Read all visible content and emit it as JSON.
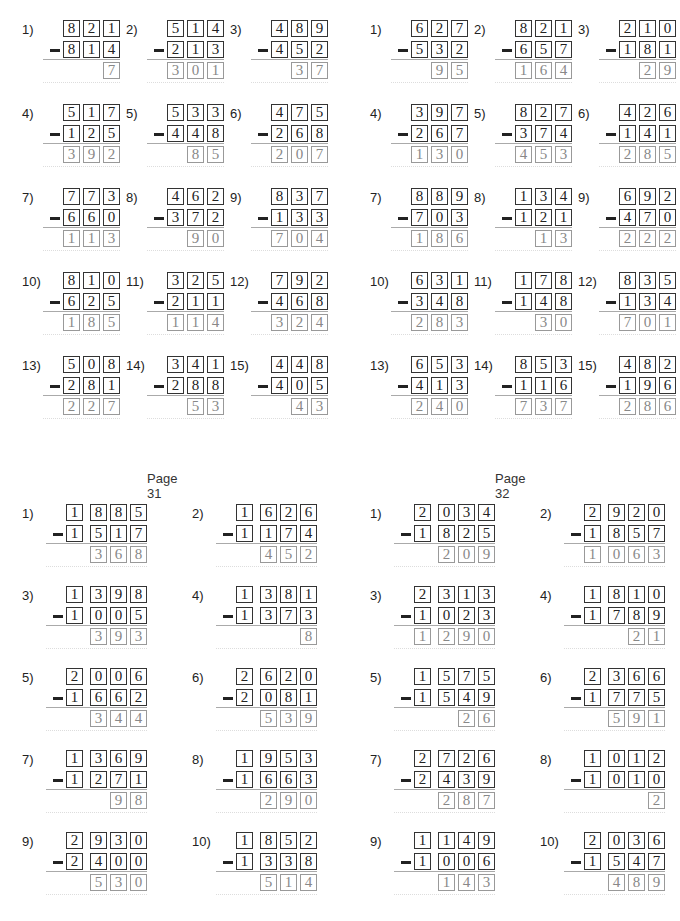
{
  "pages": [
    {
      "label": "",
      "grid": "3digit",
      "x0": 22,
      "y0": 20,
      "problems": [
        {
          "n": "1)",
          "top": "821",
          "bottom": "814",
          "answer": "7"
        },
        {
          "n": "2)",
          "top": "514",
          "bottom": "213",
          "answer": "301"
        },
        {
          "n": "3)",
          "top": "489",
          "bottom": "452",
          "answer": "37"
        },
        {
          "n": "4)",
          "top": "517",
          "bottom": "125",
          "answer": "392"
        },
        {
          "n": "5)",
          "top": "533",
          "bottom": "448",
          "answer": "85"
        },
        {
          "n": "6)",
          "top": "475",
          "bottom": "268",
          "answer": "207"
        },
        {
          "n": "7)",
          "top": "773",
          "bottom": "660",
          "answer": "113"
        },
        {
          "n": "8)",
          "top": "462",
          "bottom": "372",
          "answer": "90"
        },
        {
          "n": "9)",
          "top": "837",
          "bottom": "133",
          "answer": "704"
        },
        {
          "n": "10)",
          "top": "810",
          "bottom": "625",
          "answer": "185"
        },
        {
          "n": "11)",
          "top": "325",
          "bottom": "211",
          "answer": "114"
        },
        {
          "n": "12)",
          "top": "792",
          "bottom": "468",
          "answer": "324"
        },
        {
          "n": "13)",
          "top": "508",
          "bottom": "281",
          "answer": "227"
        },
        {
          "n": "14)",
          "top": "341",
          "bottom": "288",
          "answer": "53"
        },
        {
          "n": "15)",
          "top": "448",
          "bottom": "405",
          "answer": "43"
        }
      ]
    },
    {
      "label": "",
      "grid": "3digit",
      "x0": 370,
      "y0": 20,
      "problems": [
        {
          "n": "1)",
          "top": "627",
          "bottom": "532",
          "answer": "95"
        },
        {
          "n": "2)",
          "top": "821",
          "bottom": "657",
          "answer": "164"
        },
        {
          "n": "3)",
          "top": "210",
          "bottom": "181",
          "answer": "29"
        },
        {
          "n": "4)",
          "top": "397",
          "bottom": "267",
          "answer": "130"
        },
        {
          "n": "5)",
          "top": "827",
          "bottom": "374",
          "answer": "453"
        },
        {
          "n": "6)",
          "top": "426",
          "bottom": "141",
          "answer": "285"
        },
        {
          "n": "7)",
          "top": "889",
          "bottom": "703",
          "answer": "186"
        },
        {
          "n": "8)",
          "top": "134",
          "bottom": "121",
          "answer": "13"
        },
        {
          "n": "9)",
          "top": "692",
          "bottom": "470",
          "answer": "222"
        },
        {
          "n": "10)",
          "top": "631",
          "bottom": "348",
          "answer": "283"
        },
        {
          "n": "11)",
          "top": "178",
          "bottom": "148",
          "answer": "30"
        },
        {
          "n": "12)",
          "top": "835",
          "bottom": "134",
          "answer": "701"
        },
        {
          "n": "13)",
          "top": "653",
          "bottom": "413",
          "answer": "240"
        },
        {
          "n": "14)",
          "top": "853",
          "bottom": "116",
          "answer": "737"
        },
        {
          "n": "15)",
          "top": "482",
          "bottom": "196",
          "answer": "286"
        }
      ]
    },
    {
      "label": "Page 31",
      "grid": "4digit",
      "x0": 22,
      "y0": 504,
      "problems": [
        {
          "n": "1)",
          "top": "1885",
          "bottom": "1517",
          "answer": "368"
        },
        {
          "n": "2)",
          "top": "1626",
          "bottom": "1174",
          "answer": "452"
        },
        {
          "n": "3)",
          "top": "1398",
          "bottom": "1005",
          "answer": "393"
        },
        {
          "n": "4)",
          "top": "1381",
          "bottom": "1373",
          "answer": "8"
        },
        {
          "n": "5)",
          "top": "2006",
          "bottom": "1662",
          "answer": "344"
        },
        {
          "n": "6)",
          "top": "2620",
          "bottom": "2081",
          "answer": "539"
        },
        {
          "n": "7)",
          "top": "1369",
          "bottom": "1271",
          "answer": "98"
        },
        {
          "n": "8)",
          "top": "1953",
          "bottom": "1663",
          "answer": "290"
        },
        {
          "n": "9)",
          "top": "2930",
          "bottom": "2400",
          "answer": "530"
        },
        {
          "n": "10)",
          "top": "1852",
          "bottom": "1338",
          "answer": "514"
        }
      ]
    },
    {
      "label": "Page 32",
      "grid": "4digit",
      "x0": 370,
      "y0": 504,
      "problems": [
        {
          "n": "1)",
          "top": "2034",
          "bottom": "1825",
          "answer": "209"
        },
        {
          "n": "2)",
          "top": "2920",
          "bottom": "1857",
          "answer": "1063"
        },
        {
          "n": "3)",
          "top": "2313",
          "bottom": "1023",
          "answer": "1290"
        },
        {
          "n": "4)",
          "top": "1810",
          "bottom": "1789",
          "answer": "21"
        },
        {
          "n": "5)",
          "top": "1575",
          "bottom": "1549",
          "answer": "26"
        },
        {
          "n": "6)",
          "top": "2366",
          "bottom": "1775",
          "answer": "591"
        },
        {
          "n": "7)",
          "top": "2726",
          "bottom": "2439",
          "answer": "287"
        },
        {
          "n": "8)",
          "top": "1012",
          "bottom": "1010",
          "answer": "2"
        },
        {
          "n": "9)",
          "top": "1149",
          "bottom": "1006",
          "answer": "143"
        },
        {
          "n": "10)",
          "top": "2036",
          "bottom": "1547",
          "answer": "489"
        }
      ]
    }
  ],
  "operator": "minus"
}
